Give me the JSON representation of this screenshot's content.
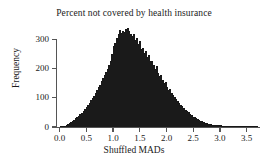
{
  "chart_data": {
    "type": "bar",
    "title": "Percent not covered by health insurance",
    "xlabel": "Shuffled MADs",
    "ylabel": "Frequency",
    "xlim": [
      -0.05,
      3.75
    ],
    "ylim": [
      0,
      340
    ],
    "grid": false,
    "legend": null,
    "bin_width": 0.0285,
    "xticks": [
      0.0,
      0.5,
      1.0,
      1.5,
      2.0,
      2.5,
      3.0,
      3.5
    ],
    "xtick_labels": [
      "0.0",
      "0.5",
      "1.0",
      "1.5",
      "2.0",
      "2.5",
      "3.0",
      "3.5"
    ],
    "yticks": [
      0,
      100,
      200,
      300
    ],
    "ytick_labels": [
      "0",
      "100",
      "200",
      "300"
    ],
    "bar_color": "#4d4d4d",
    "edge_color": "#1a1a1a",
    "axis_color": "#555555",
    "x": [
      0.0143,
      0.0428,
      0.0713,
      0.0998,
      0.1283,
      0.1568,
      0.1853,
      0.2138,
      0.2423,
      0.2708,
      0.2993,
      0.3278,
      0.3563,
      0.3848,
      0.4133,
      0.4418,
      0.4703,
      0.4988,
      0.5273,
      0.5558,
      0.5843,
      0.6128,
      0.6413,
      0.6698,
      0.6983,
      0.7268,
      0.7553,
      0.7838,
      0.8123,
      0.8408,
      0.8693,
      0.8978,
      0.9263,
      0.9548,
      0.9833,
      1.0118,
      1.0403,
      1.0688,
      1.0973,
      1.1258,
      1.1543,
      1.1828,
      1.2113,
      1.2398,
      1.2683,
      1.2968,
      1.3253,
      1.3538,
      1.3823,
      1.4108,
      1.4393,
      1.4678,
      1.4963,
      1.5248,
      1.5533,
      1.5818,
      1.6103,
      1.6388,
      1.6673,
      1.6958,
      1.7243,
      1.7528,
      1.7813,
      1.8098,
      1.8383,
      1.8668,
      1.8953,
      1.9238,
      1.9523,
      1.9808,
      2.0093,
      2.0378,
      2.0663,
      2.0948,
      2.1233,
      2.1518,
      2.1803,
      2.2088,
      2.2373,
      2.2658,
      2.2943,
      2.3228,
      2.3513,
      2.3798,
      2.4083,
      2.4368,
      2.4653,
      2.4938,
      2.5223,
      2.5508,
      2.5793,
      2.6078,
      2.6363,
      2.6648,
      2.6933,
      2.7218,
      2.7503,
      2.7788,
      2.8073,
      2.8358,
      2.8643,
      2.8928,
      2.9213,
      2.9498,
      2.9783,
      3.0068,
      3.0353,
      3.0638,
      3.0923,
      3.1208,
      3.1493,
      3.1778,
      3.2063,
      3.2348,
      3.2633,
      3.2918,
      3.3203,
      3.3488,
      3.3773,
      3.4058,
      3.4343,
      3.4628,
      3.4913,
      3.5198,
      3.5483,
      3.5768,
      3.6053,
      3.6338,
      3.6623,
      3.6908
    ],
    "values": [
      1,
      2,
      3,
      5,
      8,
      10,
      14,
      17,
      22,
      25,
      30,
      34,
      38,
      43,
      48,
      55,
      62,
      68,
      76,
      84,
      92,
      100,
      108,
      118,
      126,
      136,
      146,
      158,
      168,
      180,
      190,
      200,
      214,
      228,
      250,
      278,
      288,
      304,
      318,
      332,
      322,
      330,
      326,
      336,
      340,
      330,
      318,
      312,
      320,
      300,
      304,
      286,
      296,
      268,
      272,
      254,
      262,
      240,
      246,
      226,
      228,
      212,
      200,
      208,
      186,
      176,
      180,
      162,
      150,
      154,
      138,
      128,
      132,
      118,
      110,
      104,
      96,
      90,
      84,
      76,
      72,
      66,
      60,
      54,
      50,
      44,
      40,
      36,
      33,
      30,
      27,
      24,
      21,
      19,
      17,
      15,
      13,
      12,
      10,
      9,
      8,
      8,
      7,
      6,
      6,
      7,
      5,
      5,
      4,
      4,
      3,
      3,
      3,
      2,
      2,
      2,
      2,
      2,
      1,
      1,
      1,
      1,
      1,
      1,
      2,
      1,
      1,
      1,
      1,
      2
    ]
  }
}
